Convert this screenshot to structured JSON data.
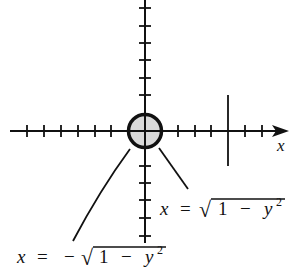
{
  "figure": {
    "colors": {
      "ink": "#111111",
      "circle_fill": "#d9d9d9",
      "background": "#ffffff"
    },
    "axes": {
      "x_label": "x",
      "origin": [
        145,
        131
      ],
      "tick_spacing_px": 17.2,
      "x_ticks_left": 7,
      "x_ticks_right": 5,
      "y_ticks_up": 6,
      "y_ticks_down": 5,
      "long_marker_x": 228
    },
    "circle": {
      "cx": 145,
      "cy": 131,
      "r": 17
    },
    "labels": {
      "right_branch": {
        "lhs": "x",
        "eq": "=",
        "radical": "√",
        "radicand_1": "1",
        "minus": "−",
        "radicand_y": "y",
        "exponent": "2"
      },
      "left_branch": {
        "lhs": "x",
        "eq": "=",
        "neg": "−",
        "radical": "√",
        "radicand_1": "1",
        "minus": "−",
        "radicand_y": "y",
        "exponent": "2"
      }
    }
  }
}
